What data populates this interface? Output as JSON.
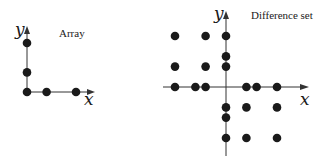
{
  "panels": [
    {
      "id": "array",
      "title": "Array",
      "x_label": "x",
      "y_label": "y",
      "points": [
        [
          0,
          0
        ],
        [
          2,
          0
        ],
        [
          5,
          0
        ],
        [
          0,
          2
        ],
        [
          0,
          5
        ]
      ]
    },
    {
      "id": "difference",
      "title": "Difference set",
      "x_label": "x",
      "y_label": "y",
      "points": [
        [
          -5,
          5
        ],
        [
          -2,
          5
        ],
        [
          0,
          5
        ],
        [
          0,
          3
        ],
        [
          -5,
          2
        ],
        [
          -2,
          2
        ],
        [
          0,
          2
        ],
        [
          -5,
          0
        ],
        [
          -3,
          0
        ],
        [
          -2,
          0
        ],
        [
          2,
          0
        ],
        [
          3,
          0
        ],
        [
          5,
          0
        ],
        [
          0,
          -2
        ],
        [
          2,
          -2
        ],
        [
          5,
          -2
        ],
        [
          0,
          -3
        ],
        [
          0,
          -5
        ],
        [
          2,
          -5
        ],
        [
          5,
          -5
        ]
      ]
    }
  ],
  "colors": {
    "dot": "#1a1a1a",
    "axis": "#333333"
  }
}
